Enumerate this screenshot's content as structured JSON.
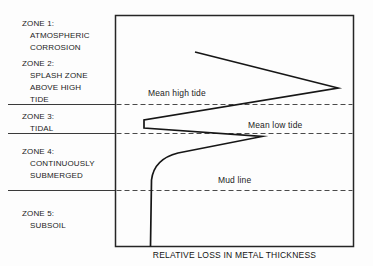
{
  "figure": {
    "zones": [
      {
        "lines": [
          "ZONE 1:",
          "ATMOSPHERIC",
          "CORROSION"
        ]
      },
      {
        "lines": [
          "ZONE 2:",
          "SPLASH ZONE",
          "ABOVE HIGH",
          "TIDE"
        ]
      },
      {
        "lines": [
          "ZONE 3:",
          "TIDAL"
        ]
      },
      {
        "lines": [
          "ZONE 4:",
          "CONTINUOUSLY",
          "SUBMERGED"
        ]
      },
      {
        "lines": [
          "ZONE 5:",
          "SUBSOIL"
        ]
      }
    ],
    "levels": [
      {
        "label": "Mean high tide"
      },
      {
        "label": "Mean low tide"
      },
      {
        "label": "Mud line"
      }
    ],
    "x_axis_label": "RELATIVE LOSS IN METAL THICKNESS",
    "curve": {
      "description": "Relative loss in metal thickness profile: greatest loss in splash zone above high tide, sharp minimum notch in tidal zone, secondary peak just below mean low tide, decreasing to small constant loss below mud line",
      "path": "M195,52 L338,88 L144,120 L144,128 L262,136.5 L178,153 Q154,159 151.5,180 L150.5,246.2"
    },
    "colors": {
      "ink": "#1c1c1c",
      "line": "#161616",
      "background": "#fdfdfd"
    }
  }
}
